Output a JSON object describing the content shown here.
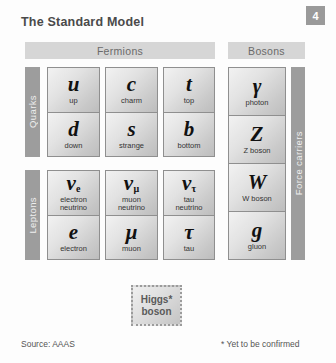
{
  "title": "The Standard Model",
  "page_badge": "4",
  "sections": {
    "fermions_label": "Fermions",
    "bosons_label": "Bosons"
  },
  "side_labels": {
    "quarks": "Quarks",
    "leptons": "Leptons",
    "force_carriers": "Force carriers"
  },
  "fermions": {
    "quarks": [
      {
        "symbol": "u",
        "subscript": "",
        "name": "up",
        "name2": ""
      },
      {
        "symbol": "d",
        "subscript": "",
        "name": "down",
        "name2": ""
      },
      {
        "symbol": "c",
        "subscript": "",
        "name": "charm",
        "name2": ""
      },
      {
        "symbol": "s",
        "subscript": "",
        "name": "strange",
        "name2": ""
      },
      {
        "symbol": "t",
        "subscript": "",
        "name": "top",
        "name2": ""
      },
      {
        "symbol": "b",
        "subscript": "",
        "name": "bottom",
        "name2": ""
      }
    ],
    "leptons": [
      {
        "symbol": "ν",
        "subscript": "e",
        "name": "electron",
        "name2": "neutrino"
      },
      {
        "symbol": "e",
        "subscript": "",
        "name": "electron",
        "name2": ""
      },
      {
        "symbol": "ν",
        "subscript": "μ",
        "name": "muon",
        "name2": "neutrino"
      },
      {
        "symbol": "μ",
        "subscript": "",
        "name": "muon",
        "name2": ""
      },
      {
        "symbol": "ν",
        "subscript": "τ",
        "name": "tau",
        "name2": "neutrino"
      },
      {
        "symbol": "τ",
        "subscript": "",
        "name": "tau",
        "name2": ""
      }
    ]
  },
  "bosons": [
    {
      "symbol": "γ",
      "name": "photon"
    },
    {
      "symbol": "Z",
      "name": "Z boson"
    },
    {
      "symbol": "W",
      "name": "W boson"
    },
    {
      "symbol": "g",
      "name": "gluon"
    }
  ],
  "higgs": {
    "line1": "Higgs*",
    "line2": "boson"
  },
  "footer": {
    "source": "Source: AAAS",
    "confirm_note": "* Yet to be confirmed"
  },
  "colors": {
    "background": "#fdfdfd",
    "bar_gray": "#d6d6d6",
    "side_bar_gray": "#9d9d9d",
    "badge_gray": "#9a9a9a",
    "cell_border": "#8f8f8f",
    "title_text": "#4a4a4a"
  }
}
